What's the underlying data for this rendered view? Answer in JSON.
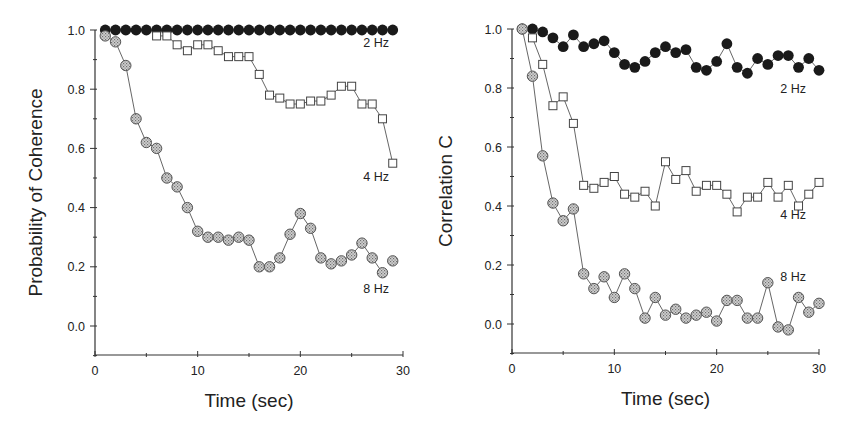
{
  "figure": {
    "panels": [
      "left",
      "right"
    ]
  },
  "styles": {
    "axis_color": "#333333",
    "line_color": "#555555",
    "filled_marker": "#1a1a1a",
    "open_marker_stroke": "#444444",
    "speckled_marker_fill": "#b8b8b8",
    "speckled_marker_stroke": "#555555"
  },
  "chart_data": [
    {
      "type": "line",
      "id": "left",
      "title": "",
      "xlabel": "Time (sec)",
      "ylabel": "Probability of Coherence",
      "xlim": [
        0,
        30
      ],
      "ylim": [
        -0.1,
        1.0
      ],
      "xticks": [
        0,
        10,
        20,
        30
      ],
      "xtick_labels": [
        "0",
        "10",
        "20",
        "30"
      ],
      "yticks": [
        0.0,
        0.2,
        0.4,
        0.6,
        0.8,
        1.0
      ],
      "ytick_labels": [
        "0.0",
        "0.2",
        "0.4",
        "0.6",
        "0.8",
        "1.0"
      ],
      "grid": false,
      "legend": "inline labels at right end of series",
      "series": [
        {
          "name": "2 Hz",
          "marker": "filled-circle",
          "label_pos": [
            389,
            47
          ],
          "x": [
            1,
            2,
            3,
            4,
            5,
            6,
            7,
            8,
            9,
            10,
            11,
            12,
            13,
            14,
            15,
            16,
            17,
            18,
            19,
            20,
            21,
            22,
            23,
            24,
            25,
            26,
            27,
            28,
            29
          ],
          "values": [
            1.0,
            1.0,
            1.0,
            1.0,
            1.0,
            1.0,
            1.0,
            1.0,
            1.0,
            1.0,
            1.0,
            1.0,
            1.0,
            1.0,
            1.0,
            1.0,
            1.0,
            1.0,
            1.0,
            1.0,
            1.0,
            1.0,
            1.0,
            1.0,
            1.0,
            1.0,
            1.0,
            1.0,
            1.0
          ]
        },
        {
          "name": "4 Hz",
          "marker": "open-square",
          "label_pos": [
            389,
            181
          ],
          "x": [
            6,
            7,
            8,
            9,
            10,
            11,
            12,
            13,
            14,
            15,
            16,
            17,
            18,
            19,
            20,
            21,
            22,
            23,
            24,
            25,
            26,
            27,
            28,
            29
          ],
          "values": [
            0.98,
            0.98,
            0.95,
            0.93,
            0.95,
            0.95,
            0.93,
            0.91,
            0.91,
            0.91,
            0.85,
            0.78,
            0.77,
            0.75,
            0.75,
            0.76,
            0.76,
            0.78,
            0.81,
            0.81,
            0.75,
            0.75,
            0.7,
            0.55
          ]
        },
        {
          "name": "8 Hz",
          "marker": "speckled-circle",
          "label_pos": [
            389,
            293
          ],
          "x": [
            1,
            2,
            3,
            4,
            5,
            6,
            7,
            8,
            9,
            10,
            11,
            12,
            13,
            14,
            15,
            16,
            17,
            18,
            19,
            20,
            21,
            22,
            23,
            24,
            25,
            26,
            27,
            28,
            29
          ],
          "values": [
            0.98,
            0.96,
            0.88,
            0.7,
            0.62,
            0.6,
            0.5,
            0.47,
            0.4,
            0.32,
            0.3,
            0.3,
            0.29,
            0.3,
            0.29,
            0.2,
            0.2,
            0.23,
            0.31,
            0.38,
            0.33,
            0.23,
            0.21,
            0.22,
            0.24,
            0.28,
            0.23,
            0.18,
            0.22
          ],
          "breaks_after_index": [
            27
          ]
        }
      ],
      "frame": {
        "x0": 95,
        "x1": 403,
        "y_top": 30,
        "y_zero": 326,
        "y_bottom": 355,
        "ylabel_x": 42,
        "xlabel_y": 407
      }
    },
    {
      "type": "line",
      "id": "right",
      "title": "",
      "xlabel": "Time (sec)",
      "ylabel": "Correlation C",
      "xlim": [
        0,
        30
      ],
      "ylim": [
        -0.1,
        1.0
      ],
      "xticks": [
        0,
        10,
        20,
        30
      ],
      "xtick_labels": [
        "0",
        "10",
        "20",
        "30"
      ],
      "yticks": [
        0.0,
        0.2,
        0.4,
        0.6,
        0.8,
        1.0
      ],
      "ytick_labels": [
        "0.0",
        "0.2",
        "0.4",
        "0.6",
        "0.8",
        "1.0"
      ],
      "grid": false,
      "legend": "inline labels at right end of series",
      "series": [
        {
          "name": "2 Hz",
          "marker": "filled-circle",
          "label_pos": [
            806,
            93
          ],
          "x": [
            1,
            2,
            3,
            4,
            5,
            6,
            7,
            8,
            9,
            10,
            11,
            12,
            13,
            14,
            15,
            16,
            17,
            18,
            19,
            20,
            21,
            22,
            23,
            24,
            25,
            26,
            27,
            28,
            29,
            30
          ],
          "values": [
            1.0,
            1.0,
            0.99,
            0.97,
            0.94,
            0.98,
            0.94,
            0.95,
            0.96,
            0.92,
            0.88,
            0.87,
            0.89,
            0.92,
            0.94,
            0.92,
            0.93,
            0.87,
            0.86,
            0.89,
            0.95,
            0.87,
            0.85,
            0.9,
            0.88,
            0.91,
            0.91,
            0.87,
            0.9,
            0.86
          ]
        },
        {
          "name": "4 Hz",
          "marker": "open-square",
          "label_pos": [
            806,
            219
          ],
          "x": [
            2,
            3,
            4,
            5,
            6,
            7,
            8,
            9,
            10,
            11,
            12,
            13,
            14,
            15,
            16,
            17,
            18,
            19,
            20,
            21,
            22,
            23,
            24,
            25,
            26,
            27,
            28,
            29,
            30
          ],
          "values": [
            0.97,
            0.88,
            0.74,
            0.77,
            0.68,
            0.47,
            0.46,
            0.48,
            0.5,
            0.44,
            0.43,
            0.45,
            0.4,
            0.55,
            0.49,
            0.52,
            0.45,
            0.47,
            0.47,
            0.44,
            0.38,
            0.43,
            0.43,
            0.48,
            0.43,
            0.47,
            0.4,
            0.44,
            0.48
          ]
        },
        {
          "name": "8 Hz",
          "marker": "speckled-circle",
          "label_pos": [
            806,
            281
          ],
          "x": [
            1,
            2,
            3,
            4,
            5,
            6,
            7,
            8,
            9,
            10,
            11,
            12,
            13,
            14,
            15,
            16,
            17,
            18,
            19,
            20,
            21,
            22,
            23,
            24,
            25,
            26,
            27,
            28,
            29,
            30
          ],
          "values": [
            1.0,
            0.84,
            0.57,
            0.41,
            0.35,
            0.39,
            0.17,
            0.12,
            0.16,
            0.09,
            0.17,
            0.12,
            0.02,
            0.09,
            0.03,
            0.05,
            0.02,
            0.03,
            0.04,
            0.01,
            0.08,
            0.08,
            0.02,
            0.02,
            0.14,
            -0.01,
            -0.02,
            0.09,
            0.04,
            0.07
          ]
        }
      ],
      "frame": {
        "x0": 512,
        "x1": 819,
        "y_top": 29,
        "y_zero": 324,
        "y_bottom": 353,
        "ylabel_x": 452,
        "xlabel_y": 405
      }
    }
  ]
}
